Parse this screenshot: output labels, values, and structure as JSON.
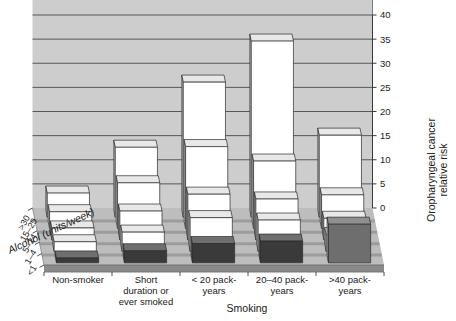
{
  "chart_data": {
    "type": "bar",
    "title": "",
    "subtitle": "",
    "xlabel": "Smoking",
    "ylabel": "Oropharyngeal cancer relative risk",
    "zlabel": "Alcohol (units/week)",
    "ylim": [
      0,
      40
    ],
    "yticks": [
      0,
      5,
      10,
      15,
      20,
      25,
      30,
      35,
      40
    ],
    "grid": true,
    "legend": "none",
    "categories": [
      "Non-smoker",
      "Short duration or ever smoked",
      "< 20 pack-years",
      "20–40 pack-years",
      "> 40 pack-years"
    ],
    "depth_categories": [
      ">30",
      "15–29",
      "5–14",
      "1–4",
      "<1"
    ],
    "series": [
      {
        "name": ">30",
        "values": [
          5.0,
          14.5,
          28.0,
          36.5,
          17.0
        ]
      },
      {
        "name": "15–29",
        "values": [
          3.5,
          9.5,
          17.0,
          14.0,
          7.0
        ]
      },
      {
        "name": "5–14",
        "values": [
          2.5,
          6.0,
          9.5,
          8.5,
          4.5
        ]
      },
      {
        "name": "1–4",
        "values": [
          2.0,
          4.0,
          7.0,
          6.5,
          3.5
        ]
      },
      {
        "name": "<1",
        "values": [
          1.0,
          2.5,
          4.0,
          4.5,
          8.0
        ]
      }
    ]
  },
  "axes": {
    "y_tick_labels": [
      "0",
      "5",
      "10",
      "15",
      "20",
      "25",
      "30",
      "35",
      "40"
    ],
    "y_axis_title_line1": "Oropharyngeal cancer",
    "y_axis_title_line2": "relative risk",
    "x_axis_title": "Smoking",
    "z_axis_title": "Alcohol (units/week)",
    "x_category_labels": [
      [
        "Non-smoker"
      ],
      [
        "Short",
        "duration or",
        "ever smoked"
      ],
      [
        "< 20 pack-",
        "years"
      ],
      [
        "20–40 pack-",
        "years"
      ],
      [
        ">40 pack-",
        "years"
      ]
    ],
    "z_category_labels": [
      ">30",
      "15–29",
      "5–14",
      "1–4",
      "<1"
    ]
  },
  "colors": {
    "wall": "#cdcdcd",
    "wall_line": "#4a4a4a",
    "floor_top": "#bdbdbd",
    "floor_front": "#8a8a8a",
    "floor_edge": "#6b6b6b",
    "bar_light_front": "#ffffff",
    "bar_light_top": "#e8e8e8",
    "bar_light_side": "#c9c9c9",
    "bar_dark_front": "#3a3a3a",
    "bar_dark_top": "#6f6f6f",
    "bar_dark_side": "#555555",
    "bar_mid_front": "#6e6e6e",
    "bar_mid_top": "#8f8f8f",
    "bar_mid_side": "#a6a6a6",
    "outline": "#2b2b2b",
    "text": "#1a1a1a",
    "background": "#ffffff"
  }
}
